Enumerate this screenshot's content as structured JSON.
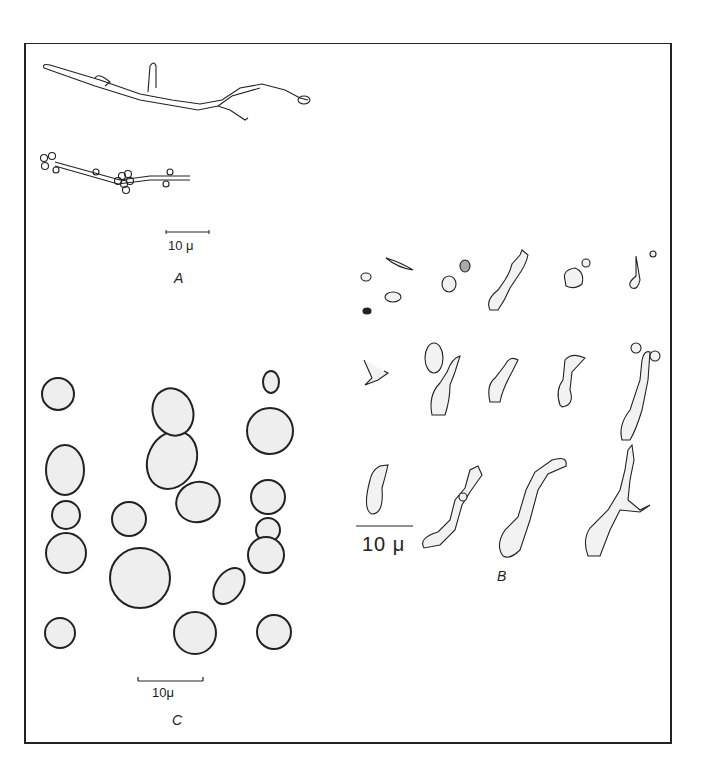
{
  "figure": {
    "panels": [
      {
        "id": "A",
        "label": "A",
        "scale_bar": "10 μ",
        "content": "branched hyphae with lateral buds and budding cluster"
      },
      {
        "id": "B",
        "label": "B",
        "scale_bar": "10 μ",
        "content": "elongated germinating cells and pseudohyphae"
      },
      {
        "id": "C",
        "label": "C",
        "scale_bar": "10μ",
        "content": "round budding yeast cells"
      }
    ]
  }
}
